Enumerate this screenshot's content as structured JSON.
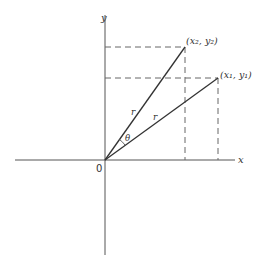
{
  "diagram": {
    "type": "coordinate-rotation",
    "axes": {
      "x_label": "x",
      "y_label": "y",
      "origin_label": "0"
    },
    "points": [
      {
        "id": "p2",
        "label": "(x₂, y₂)"
      },
      {
        "id": "p1",
        "label": "(x₁, y₁)"
      }
    ],
    "segments": [
      {
        "from": "origin",
        "to": "p2",
        "label": "r"
      },
      {
        "from": "origin",
        "to": "p1",
        "label": "r"
      }
    ],
    "angle_label": "θ"
  }
}
